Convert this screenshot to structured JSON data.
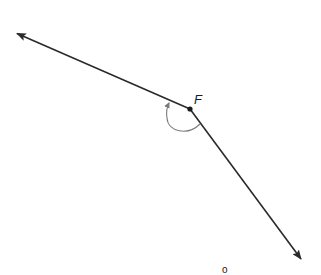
{
  "diagram": {
    "type": "angle",
    "vertex": {
      "label": "F",
      "x": 190,
      "y": 109
    },
    "rays": [
      {
        "name": "left-ray",
        "from": [
          190,
          109
        ],
        "to": [
          16,
          33
        ],
        "arrow": true
      },
      {
        "name": "right-ray",
        "from": [
          190,
          109
        ],
        "to": [
          302,
          260
        ],
        "arrow": true
      }
    ],
    "angle_arc": {
      "direction": "arrow-marked",
      "color": "#7a7a7a"
    },
    "measure_label": "o",
    "colors": {
      "line": "#2a2a2a",
      "arc": "#7a7a7a",
      "background": "#ffffff"
    }
  }
}
